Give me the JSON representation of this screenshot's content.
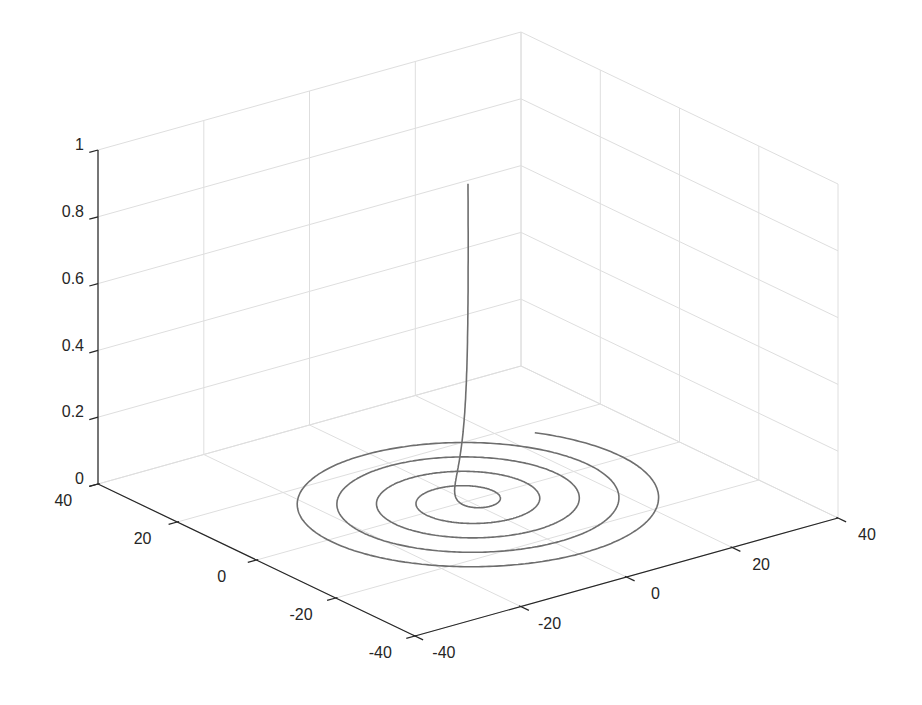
{
  "chart_data": {
    "type": "line3d",
    "title": "",
    "xlabel": "",
    "ylabel": "",
    "zlabel": "",
    "xlim": [
      -40,
      40
    ],
    "ylim": [
      -40,
      40
    ],
    "zlim": [
      0,
      1
    ],
    "x_ticks": [
      -40,
      -20,
      0,
      20,
      40
    ],
    "y_ticks": [
      -40,
      -20,
      0,
      20,
      40
    ],
    "z_ticks": [
      0,
      0.2,
      0.4,
      0.6,
      0.8,
      1
    ],
    "x_tick_labels": [
      "-40",
      "-20",
      "0",
      "20",
      "40"
    ],
    "y_tick_labels": [
      "-40",
      "-20",
      "0",
      "20",
      "40"
    ],
    "z_tick_labels": [
      "0",
      "0.2",
      "0.4",
      "0.6",
      "0.8",
      "1"
    ],
    "grid": true,
    "legend": null,
    "series": [
      {
        "name": "spiral",
        "description": "Planar spiral x = t*cos(t), y = t*sin(t) for t in [0, ~10*pi], with z rising steeply near the center (z ~ exp(-t)), peaking near 0.95",
        "t_range": [
          0,
          31.4
        ],
        "radius_max": 30,
        "z_max": 0.95,
        "color": "#707070"
      }
    ]
  },
  "colors": {
    "axis": "#262626",
    "grid": "#dedede",
    "line": "#6e6e6e"
  }
}
